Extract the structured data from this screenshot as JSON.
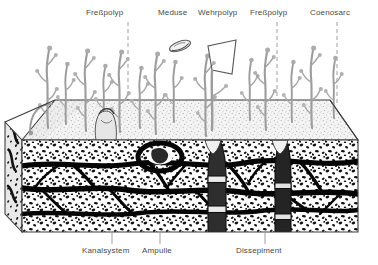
{
  "figure": {
    "language": "de",
    "background_color": "#ffffff",
    "ink_color": "#2b2b2b",
    "label_color": "#4a4a4a",
    "stipple_top_color": "#c9c9c9",
    "polyp_color": "#b8b8b8"
  },
  "labels": {
    "top": [
      {
        "id": "fresspolyp-left",
        "text": "Freßpolyp",
        "x": 86,
        "y": 8,
        "leader": {
          "type": "dashed-vertical",
          "x": 128,
          "y1": 22,
          "y2": 100
        }
      },
      {
        "id": "meduse",
        "text": "Meduse",
        "x": 158,
        "y": 8,
        "leader": {
          "type": "angled",
          "x1": 180,
          "y1": 22,
          "x2": 196,
          "y2": 40
        }
      },
      {
        "id": "wehrpolyp",
        "text": "Wehrpolyp",
        "x": 198,
        "y": 8,
        "leader": {
          "type": "angled",
          "x1": 224,
          "y1": 22,
          "x2": 236,
          "y2": 40
        }
      },
      {
        "id": "fresspolyp-right",
        "text": "Freßpolyp",
        "x": 250,
        "y": 8,
        "leader": {
          "type": "dashed-vertical",
          "x": 277,
          "y1": 22,
          "y2": 100
        }
      },
      {
        "id": "coenosarc",
        "text": "Coenosarc",
        "x": 310,
        "y": 8,
        "leader": {
          "type": "dashed-vertical",
          "x": 337,
          "y1": 22,
          "y2": 104
        }
      }
    ],
    "bottom": [
      {
        "id": "kanalsystem",
        "text": "Kanalsystem",
        "x": 82,
        "y": 246,
        "leader": {
          "type": "vertical",
          "x": 112,
          "y1": 233,
          "y2": 244
        }
      },
      {
        "id": "ampulle",
        "text": "Ampulle",
        "x": 142,
        "y": 246,
        "leader": {
          "type": "vertical",
          "x": 160,
          "y1": 233,
          "y2": 244
        }
      },
      {
        "id": "dissepiment",
        "text": "Dissepiment",
        "x": 236,
        "y": 246,
        "leader": {
          "type": "vertical",
          "x": 265,
          "y1": 233,
          "y2": 244
        }
      }
    ]
  },
  "block": {
    "description": "Isometric cut block of coral skeleton",
    "front_top_y": 140,
    "front_bottom_y": 232,
    "left_x": 22,
    "right_x": 358,
    "top_back_y": 100,
    "top_back_left_x": 55,
    "top_back_right_x": 330,
    "layers": [
      {
        "id": "surface-stipple",
        "name": "top living surface",
        "tone": "light-stipple"
      },
      {
        "id": "canal-layer",
        "name": "Kanalsystem",
        "tone": "coarse-stipple-with-dark-canals"
      }
    ]
  },
  "structures": {
    "gastrozooids": {
      "name": "Freßpolyp",
      "count": 14,
      "form": "branched-with-bulbous-tips"
    },
    "dactylozooid": {
      "name": "Wehrpolyp",
      "count": 1,
      "form": "angular-elongate"
    },
    "medusa": {
      "name": "Meduse",
      "count": 1,
      "form": "lens-oval"
    },
    "ampulla": {
      "name": "Ampulle",
      "count": 1,
      "form": "dark-ring-chamber"
    },
    "dissepiments": {
      "name": "Dissepiment",
      "count": 2,
      "form": "horizontal-plates-in-vertical-tube"
    },
    "coenosarc": {
      "name": "Coenosarc",
      "form": "tissue-network-over-skeleton"
    }
  }
}
